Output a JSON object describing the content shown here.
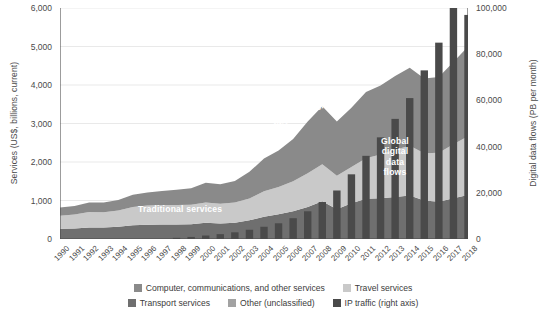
{
  "chart_data": {
    "type": "area",
    "title": "",
    "xlabel": "",
    "ylabel": "Services (US$, billions, current)",
    "y2label": "Digital data flows (PB per month)",
    "grid": true,
    "legend_position": "bottom",
    "ylim": [
      0,
      6000
    ],
    "y2lim": [
      0,
      100000
    ],
    "yticks": [
      "0",
      "1,000",
      "2,000",
      "3,000",
      "4,000",
      "5,000",
      "6,000"
    ],
    "ytick_values": [
      0,
      1000,
      2000,
      3000,
      4000,
      5000,
      6000
    ],
    "y2ticks": [
      "0",
      "20,000",
      "40,000",
      "60,000",
      "80,000",
      "100,000"
    ],
    "y2tick_values": [
      0,
      20000,
      40000,
      60000,
      80000,
      100000
    ],
    "categories": [
      "1990",
      "1991",
      "1992",
      "1993",
      "1994",
      "1995",
      "1996",
      "1997",
      "1998",
      "1999",
      "2000",
      "2001",
      "2002",
      "2003",
      "2004",
      "2005",
      "2006",
      "2007",
      "2008",
      "2009",
      "2010",
      "2011",
      "2012",
      "2013",
      "2014",
      "2015",
      "2016",
      "2017",
      "2018"
    ],
    "series": [
      {
        "name": "Transport services",
        "color": "#6f6f6f",
        "stack": "services",
        "values": [
          265,
          275,
          300,
          300,
          320,
          360,
          370,
          375,
          375,
          380,
          420,
          405,
          425,
          485,
          580,
          640,
          720,
          830,
          980,
          775,
          930,
          1045,
          1060,
          1090,
          1130,
          1000,
          970,
          1060,
          1140
        ]
      },
      {
        "name": "Travel services",
        "color": "#c9c9c9",
        "stack": "services",
        "values": [
          340,
          360,
          400,
          395,
          420,
          470,
          500,
          510,
          510,
          510,
          530,
          510,
          520,
          570,
          660,
          710,
          780,
          880,
          960,
          870,
          940,
          1055,
          1135,
          1230,
          1290,
          1230,
          1270,
          1400,
          1530
        ]
      },
      {
        "name": "Computer, communications, and other services",
        "color": "#8a8a8a",
        "stack": "services",
        "values": [
          210,
          225,
          250,
          255,
          270,
          320,
          340,
          360,
          395,
          430,
          510,
          510,
          560,
          690,
          850,
          950,
          1100,
          1340,
          1510,
          1405,
          1540,
          1720,
          1790,
          1915,
          2030,
          1940,
          1970,
          2140,
          2330
        ]
      },
      {
        "name": "Other (unclassified)",
        "color": "#575757",
        "stack": "services",
        "values": [
          0,
          0,
          0,
          0,
          0,
          0,
          0,
          0,
          0,
          0,
          0,
          0,
          0,
          0,
          0,
          0,
          0,
          0,
          0,
          0,
          0,
          0,
          0,
          0,
          0,
          0,
          0,
          0,
          0
        ]
      }
    ],
    "bar_series": {
      "name": "IP traffic (right axis)",
      "color": "#4a4a4a",
      "axis": "right",
      "unit": "PB per month",
      "values": [
        0,
        0,
        0,
        0,
        0,
        0,
        0,
        0,
        500,
        900,
        1500,
        2100,
        2900,
        4000,
        5300,
        6800,
        9000,
        12000,
        16000,
        21000,
        28000,
        36000,
        44000,
        52000,
        61000,
        73000,
        85000,
        100000,
        97000
      ]
    },
    "annotations": [
      {
        "text": "Traditional services",
        "x": 0.3,
        "y": 0.26,
        "rotation": 0
      },
      {
        "text": "Data-driven services",
        "x": 0.62,
        "y": 0.62,
        "rotation": -22
      },
      {
        "text": "Global digital data flows",
        "x": 0.86,
        "y": 0.33,
        "rotation": 0
      }
    ]
  },
  "axes": {
    "y_left_title": "Services (US$, billions, current)",
    "y_right_title": "Digital data flows (PB per month)"
  },
  "legend": {
    "row1": [
      {
        "label": "Computer, communications, and other services",
        "color": "#8a8a8a"
      },
      {
        "label": "Travel services",
        "color": "#c9c9c9"
      }
    ],
    "row2": [
      {
        "label": "Transport services",
        "color": "#6f6f6f"
      },
      {
        "label": "Other (unclassified)",
        "color": "#a2a2a2"
      },
      {
        "label": "IP traffic (right axis)",
        "color": "#4a4a4a"
      }
    ]
  },
  "annotation_labels": {
    "traditional": "Traditional services",
    "datadriven": "Data-driven services",
    "global_l1": "Global",
    "global_l2": "digital",
    "global_l3": "data",
    "global_l4": "flows"
  }
}
